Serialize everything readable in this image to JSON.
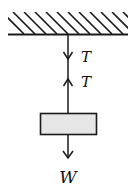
{
  "diagram": {
    "colors": {
      "line": "#1a1a1a",
      "block_fill": "#e6e6e6",
      "background": "#ffffff"
    },
    "ceiling": {
      "label": ""
    },
    "forces": [
      {
        "id": "tension-on-ceiling",
        "label": "T",
        "direction": "down"
      },
      {
        "id": "tension-on-block",
        "label": "T",
        "direction": "up"
      },
      {
        "id": "weight",
        "label": "W",
        "direction": "down"
      }
    ]
  }
}
